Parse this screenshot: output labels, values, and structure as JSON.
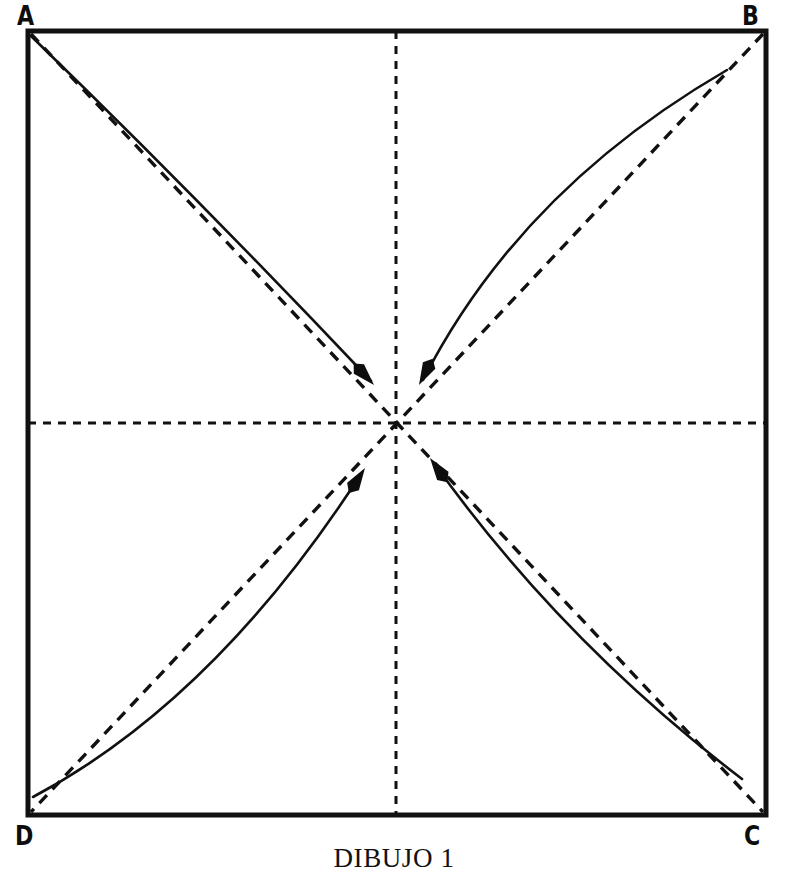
{
  "figure": {
    "caption": "DIBUJO 1",
    "corner_labels": {
      "top_left": "A",
      "top_right": "B",
      "bottom_right": "C",
      "bottom_left": "D"
    }
  },
  "chart_data": {
    "type": "diagram",
    "title": "DIBUJO 1",
    "canvas": {
      "width": 788,
      "height": 883
    },
    "square": {
      "label": "paper-square",
      "x": 28,
      "y": 31,
      "width": 738,
      "height": 784,
      "stroke": "#111111",
      "stroke_width": 5,
      "fill": "#ffffff",
      "corners": {
        "A": [
          28,
          31
        ],
        "B": [
          766,
          31
        ],
        "C": [
          766,
          815
        ],
        "D": [
          28,
          815
        ]
      }
    },
    "center_point": [
      396,
      423
    ],
    "guide_lines": [
      {
        "name": "vertical-center-fold",
        "style": "dashed",
        "from": [
          396,
          31
        ],
        "to": [
          396,
          815
        ],
        "dash": "8,7",
        "stroke_width": 3
      },
      {
        "name": "horizontal-center-fold",
        "style": "dashed",
        "from": [
          28,
          423
        ],
        "to": [
          766,
          423
        ],
        "dash": "8,7",
        "stroke_width": 3
      },
      {
        "name": "diagonal-a-to-c",
        "style": "dashed",
        "from": [
          31,
          34
        ],
        "to": [
          763,
          812
        ],
        "dash": "11,8",
        "stroke_width": 3.4
      },
      {
        "name": "diagonal-b-to-d",
        "style": "dashed",
        "from": [
          763,
          34
        ],
        "to": [
          31,
          812
        ],
        "dash": "11,8",
        "stroke_width": 3.4
      }
    ],
    "fold_arrows": [
      {
        "name": "fold-arrow-from-a",
        "from_corner": "A",
        "start": [
          31,
          36
        ],
        "control": [
          196,
          196
        ],
        "end": [
          371,
          381
        ],
        "tip": [
          374,
          385
        ],
        "direction": "down-right",
        "bulges": "above-diagonal",
        "stroke_width": 2.6
      },
      {
        "name": "fold-arrow-from-b",
        "from_corner": "B",
        "start": [
          727,
          70
        ],
        "control": [
          520,
          190
        ],
        "end": [
          423,
          380
        ],
        "tip": [
          419,
          385
        ],
        "direction": "down-left",
        "bulges": "above-diagonal",
        "stroke_width": 2.6
      },
      {
        "name": "fold-arrow-from-c",
        "from_corner": "C",
        "start": [
          742,
          779
        ],
        "control": [
          560,
          640
        ],
        "end": [
          434,
          463
        ],
        "tip": [
          430,
          458
        ],
        "direction": "up-left",
        "bulges": "above-diagonal",
        "stroke_width": 2.6
      },
      {
        "name": "fold-arrow-from-d",
        "from_corner": "D",
        "start": [
          33,
          797
        ],
        "control": [
          215,
          700
        ],
        "end": [
          361,
          474
        ],
        "tip": [
          365,
          468
        ],
        "direction": "up-right",
        "bulges": "below-diagonal",
        "stroke_width": 2.6
      }
    ],
    "arrowhead": {
      "shape": "solid-triangle",
      "length": 22,
      "half_width": 7,
      "fill": "#0d0d0d"
    },
    "colors": {
      "ink": "#111111",
      "label_ink": "#0d0d0d",
      "paper": "#ffffff"
    }
  }
}
